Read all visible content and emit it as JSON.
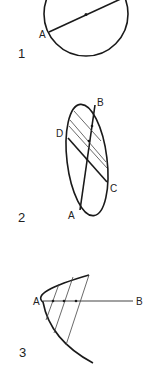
{
  "figures": [
    {
      "number": "1",
      "shape": "circle",
      "labels": {
        "a": "A"
      },
      "description": "Circle with chord through center (diameter) from point A, midpoint marked"
    },
    {
      "number": "2",
      "shape": "ellipse",
      "labels": {
        "a": "A",
        "b": "B",
        "c": "C",
        "d": "D"
      },
      "description": "Ellipse with conjugate diameters AB and DC plus parallel chords bisected by AB"
    },
    {
      "number": "3",
      "shape": "parabola",
      "labels": {
        "a": "A",
        "b": "B"
      },
      "description": "Parabola with axis AB and parallel chords bisected by the axis"
    }
  ],
  "colors": {
    "ink": "#1a1a1a",
    "background": "#ffffff"
  }
}
